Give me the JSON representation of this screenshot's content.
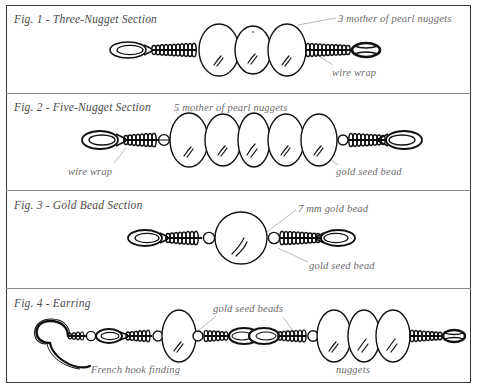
{
  "document": {
    "title": "Mother of Pearl Nugget Earring Assembly Diagram",
    "border_color": "#3a3a3a",
    "divider_color": "#8a8a8a",
    "ink_color": "#111111",
    "caption_color": "#4a4a4a",
    "annotation_color": "#6b6b6b",
    "leader_color": "#b9b9b9",
    "background": "#ffffff"
  },
  "figures": [
    {
      "id": "fig-1",
      "caption": "Fig. 1 - Three-Nugget Section",
      "component_counts": {
        "nuggets": 3,
        "wire_wraps": 2,
        "loops": 2,
        "seed_beads": 0
      },
      "annotations": [
        {
          "name": "nuggets-label",
          "text": "3 mother of pearl nuggets"
        },
        {
          "name": "wire-wrap-label",
          "text": "wire wrap"
        }
      ]
    },
    {
      "id": "fig-2",
      "caption": "Fig. 2 - Five-Nugget Section",
      "component_counts": {
        "nuggets": 5,
        "wire_wraps": 2,
        "loops": 2,
        "seed_beads": 2
      },
      "annotations": [
        {
          "name": "nuggets-label",
          "text": "5 mother of pearl nuggets"
        },
        {
          "name": "wire-wrap-label",
          "text": "wire wrap"
        },
        {
          "name": "seed-bead-label",
          "text": "gold seed bead"
        }
      ]
    },
    {
      "id": "fig-3",
      "caption": "Fig. 3 - Gold Bead Section",
      "component_counts": {
        "gold_beads": 1,
        "wire_wraps": 2,
        "loops": 2,
        "seed_beads": 2
      },
      "annotations": [
        {
          "name": "gold-bead-label",
          "text": "7 mm gold bead"
        },
        {
          "name": "seed-bead-label",
          "text": "gold seed bead"
        }
      ]
    },
    {
      "id": "fig-4",
      "caption": "Fig. 4 - Earring",
      "component_counts": {
        "nuggets": 4,
        "wire_wraps": 5,
        "loops": 4,
        "seed_beads": 4,
        "french_hooks": 1
      },
      "annotations": [
        {
          "name": "seed-beads-label",
          "text": "gold seed beads"
        },
        {
          "name": "french-hook-label",
          "text": "French hook finding"
        },
        {
          "name": "nuggets-label",
          "text": "nuggets"
        }
      ]
    }
  ]
}
